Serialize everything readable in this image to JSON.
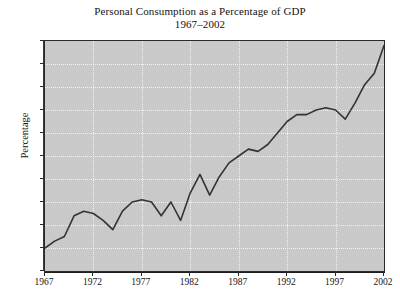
{
  "chart_data": {
    "type": "line",
    "title": "Personal Consumption as a Percentage of GDP",
    "subtitle": "1967–2002",
    "xlabel": "",
    "ylabel": "Percentage",
    "xlim": [
      1967,
      2002
    ],
    "ylim": [
      60,
      70
    ],
    "grid": true,
    "legend": "none",
    "x_ticks": [
      1967,
      1972,
      1977,
      1982,
      1987,
      1992,
      1997,
      2002
    ],
    "y_ticks": [
      60,
      61,
      62,
      63,
      64,
      65,
      66,
      67,
      68,
      69,
      70
    ],
    "series": [
      {
        "name": "Personal Consumption as a Percentage of GDP",
        "color": "#333333",
        "x": [
          1967,
          1968,
          1969,
          1970,
          1971,
          1972,
          1973,
          1974,
          1975,
          1976,
          1977,
          1978,
          1979,
          1980,
          1981,
          1982,
          1983,
          1984,
          1985,
          1986,
          1987,
          1988,
          1989,
          1990,
          1991,
          1992,
          1993,
          1994,
          1995,
          1996,
          1997,
          1998,
          1999,
          2000,
          2001,
          2002
        ],
        "values": [
          61.0,
          61.3,
          61.5,
          62.4,
          62.6,
          62.5,
          62.2,
          61.8,
          62.6,
          63.0,
          63.1,
          63.0,
          62.4,
          63.0,
          62.2,
          63.4,
          64.2,
          63.3,
          64.1,
          64.7,
          65.0,
          65.3,
          65.2,
          65.5,
          66.0,
          66.5,
          66.8,
          66.8,
          67.0,
          67.1,
          67.0,
          66.6,
          67.3,
          68.1,
          68.6,
          69.8
        ]
      }
    ]
  },
  "axes": {
    "y_tick_labels": [
      "70",
      "69",
      "68",
      "67",
      "66",
      "65",
      "64",
      "63",
      "62",
      "61",
      "60"
    ],
    "x_tick_labels": [
      "1967",
      "1972",
      "1977",
      "1982",
      "1987",
      "1992",
      "1997",
      "2002"
    ],
    "y_axis_title": "Percentage"
  },
  "style": {
    "plot_background": "#c9c9c9",
    "page_background": "#ffffff",
    "gridline_color": "#f2f2f2",
    "line_color": "#333333",
    "text_color": "#141414"
  }
}
